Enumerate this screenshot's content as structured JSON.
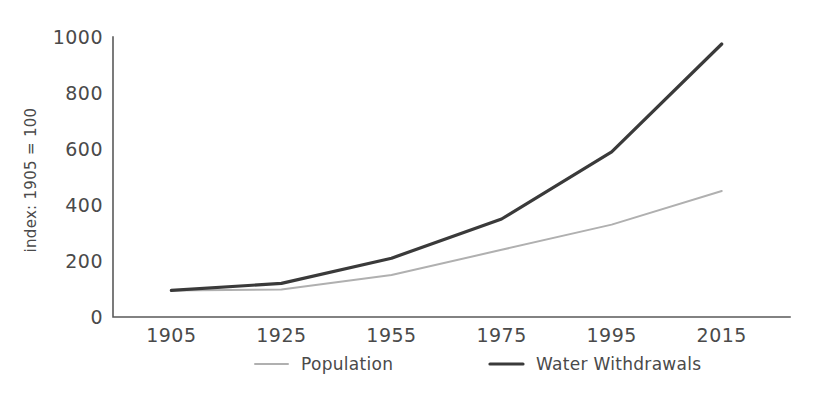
{
  "chart_data": {
    "type": "line",
    "title": "",
    "xlabel": "",
    "ylabel": "index: 1905 = 100",
    "categories": [
      "1905",
      "1925",
      "1955",
      "1975",
      "1995",
      "2015"
    ],
    "x": [
      1905,
      1925,
      1955,
      1975,
      1995,
      2015
    ],
    "series": [
      {
        "name": "Population",
        "color": "#b0b0b0",
        "stroke_width": 2,
        "values": [
          95,
          98,
          150,
          240,
          330,
          450
        ]
      },
      {
        "name": "Water Withdrawals",
        "color": "#3a3a3a",
        "stroke_width": 3.2,
        "values": [
          95,
          120,
          210,
          350,
          590,
          975
        ]
      }
    ],
    "ylim": [
      0,
      1000
    ],
    "yticks": [
      0,
      200,
      400,
      600,
      800,
      1000
    ],
    "ytick_labels": [
      "0",
      "200",
      "400",
      "600",
      "800",
      "1000"
    ],
    "grid": false,
    "legend_position": "bottom",
    "background_color": "#ffffff",
    "axis_color": "#5a5a5a",
    "text_color": "#4a4a4a"
  },
  "legend": {
    "items": [
      {
        "label": "Population",
        "color": "#b0b0b0"
      },
      {
        "label": "Water Withdrawals",
        "color": "#3a3a3a"
      }
    ]
  }
}
